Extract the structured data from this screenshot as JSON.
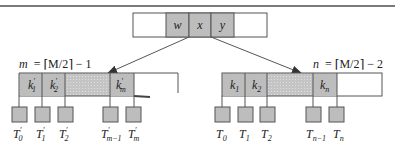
{
  "diagram": {
    "type": "b-tree-node-split",
    "colors": {
      "border": "#555555",
      "key_fill": "#bdbdbd",
      "dotted_fill": "#c9c9c9",
      "subtree_fill": "#bdbdbd",
      "arrow": "#555555",
      "rule": "#7a7a7a"
    },
    "parent_node": {
      "keys": [
        "w",
        "x",
        "y"
      ]
    },
    "left_node": {
      "size_label_lhs": "m",
      "size_label_rhs": "= ⌈M/2⌉ − 1",
      "keys": [
        {
          "base": "k",
          "prime": "′",
          "sub": "1"
        },
        {
          "base": "k",
          "prime": "′",
          "sub": "2"
        },
        {
          "base": "k",
          "prime": "′",
          "sub": "m"
        }
      ],
      "subtrees": [
        {
          "base": "T",
          "prime": "′",
          "sub": "0"
        },
        {
          "base": "T",
          "prime": "′",
          "sub": "1"
        },
        {
          "base": "T",
          "prime": "′",
          "sub": "2"
        },
        {
          "base": "T",
          "prime": "′",
          "sub": "m−1"
        },
        {
          "base": "T",
          "prime": "′",
          "sub": "m"
        }
      ]
    },
    "right_node": {
      "size_label_lhs": "n",
      "size_label_rhs": "= ⌈M/2⌉ − 2",
      "keys": [
        {
          "base": "k",
          "prime": "",
          "sub": "1"
        },
        {
          "base": "k",
          "prime": "",
          "sub": "2"
        },
        {
          "base": "k",
          "prime": "",
          "sub": "n"
        }
      ],
      "subtrees": [
        {
          "base": "T",
          "prime": "",
          "sub": "0"
        },
        {
          "base": "T",
          "prime": "",
          "sub": "1"
        },
        {
          "base": "T",
          "prime": "",
          "sub": "2"
        },
        {
          "base": "T",
          "prime": "",
          "sub": "n−1"
        },
        {
          "base": "T",
          "prime": "",
          "sub": "n"
        }
      ]
    }
  }
}
